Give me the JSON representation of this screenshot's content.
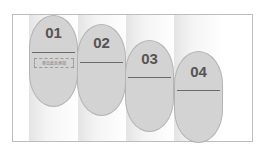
{
  "diagram": {
    "type": "step-capsules",
    "steps": [
      {
        "label": "01",
        "subtitle": "单击此处添加"
      },
      {
        "label": "02",
        "subtitle": ""
      },
      {
        "label": "03",
        "subtitle": ""
      },
      {
        "label": "04",
        "subtitle": ""
      }
    ],
    "colors": {
      "capsule": "#d3d3d3",
      "number": "#555555",
      "divider": "#6a6a6a",
      "frame": "#bdbdbd"
    }
  }
}
